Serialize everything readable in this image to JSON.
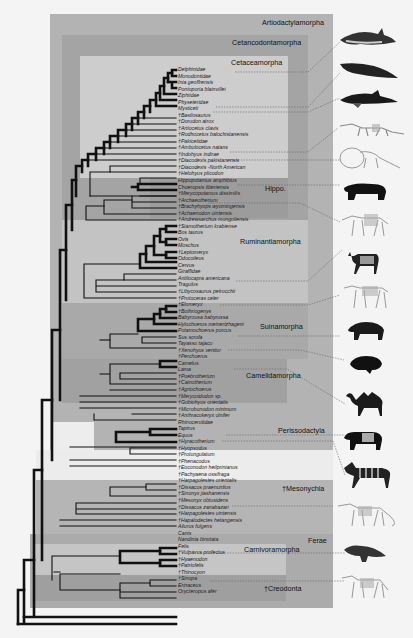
{
  "clades": {
    "artiodactylamorpha": "Artiodactylamorpha",
    "cetancodontamorpha": "Cetancodontamorpha",
    "cetaceamorpha": "Cetaceamorpha",
    "hippo": "Hippo.",
    "ruminantiamorpha": "Ruminantiamorpha",
    "suinamorpha": "Suinamorpha",
    "camelidamorpha": "Camelidamorpha",
    "perissodactyla": "Perissodactyla",
    "mesonychia": "†Mesonychia",
    "ferae": "Ferae",
    "carnivoramorpha": "Carnivoramorpha",
    "creodonta": "†Creodonta"
  },
  "colors": {
    "background": "#f4f4f4",
    "artiodactylamorpha_box": "#b3b3b3",
    "cetancodontamorpha_box": "#a3a3a3",
    "cetaceamorpha_box": "#cfcfcf",
    "hippo_box": "#9b9b9b",
    "ruminantiamorpha_box": "#c2c2c2",
    "suinamorpha_box": "#a8a8a8",
    "camelidamorpha_box": "#a0a0a0",
    "mesonychia_box": "#b5b5b5",
    "ferae_box": "#aaaaaa",
    "carnivoramorpha_box": "#c4c4c4",
    "creodonta_box": "#9e9e9e",
    "branch": "#111111"
  },
  "taxa": [
    "Delphinidae",
    "Monodontidae",
    "Inia geoffrensis",
    "Pontoporia blainvillei",
    "Ziphiidae",
    "Physeteridae",
    "Mysticeti",
    "†Basilosaurus",
    "†Dorudon atrox",
    "†Artiocetus clavis",
    "†Rodhocetus balochistanensis",
    "†Pakicetidae",
    "†Ambulocetus natans",
    "†Indohyus indirae",
    "†Diacodexis pakistanensis",
    "†Diacodexis -North American",
    "†Helohyus plicodon",
    "Hippopotamus amphibius",
    "Choeropsis liberiensis",
    "†Merycopotamus dissimilis",
    "†Archaeotherium",
    "†Brachyhyops wyomingensis",
    "†Achaenodon uintensis",
    "†Andrewsarchus mongoliensis",
    "†Siamotherium krabiense",
    "Bos taurus",
    "Ovis",
    "Moschus",
    "†Leptomeryx",
    "Odocoileus",
    "Cervus",
    "Giraffidae",
    "Antilocapra americana",
    "Tragulus",
    "†Libycosaurus petrocchii",
    "†Protoceras celer",
    "†Elomeryx",
    "†Bothriogenys",
    "Babyrousa babyrussa",
    "Hylochoerus meinertzhageni",
    "Potamochoerus porcus",
    "Sus scrofa",
    "Tayassu tajacu",
    "†Xenohyus venitor",
    "†Perchoerus",
    "Camelus",
    "Lama",
    "†Poebrotherium",
    "†Cainotherium",
    "†Agriochoerus",
    "†Merycoidodon sp.",
    "†Gobiohyus orientalis",
    "†Microbunodon minimum",
    "†Anthracokeryx ulnifer",
    "Rhinocerotidae",
    "Tapirus",
    "Equus",
    "†Hyracotherium",
    "†Hyopsodus",
    "†Protungulatum",
    "†Phenacodus",
    "†Eoconodon heilprinianus",
    "†Pachyaena ossifraga",
    "†Harpagolestes orientalis",
    "†Dissacus praenuntius",
    "†Sinonyx jiashanensis",
    "†Mesonyx obtusidens",
    "†Dissacus zanabazari",
    "†Harpagolestes uintensis",
    "†Hapalodectes hetangensis",
    "Ailurus fulgens",
    "Canis",
    "Nandinia binotata",
    "Felis",
    "†Vulpavus profectus",
    "†Hyaenodon",
    "†Patriofelis",
    "†Thinocyon",
    "†Sinopa",
    "Erinaceus",
    "Orycteropus afer"
  ],
  "illustrations": [
    {
      "name": "dolphin",
      "taxon": "Delphinidae"
    },
    {
      "name": "sperm-whale",
      "taxon": "Physeteridae"
    },
    {
      "name": "humpback-whale",
      "taxon": "Mysticeti"
    },
    {
      "name": "ambulocetus-skeleton",
      "taxon": "†Ambulocetus natans"
    },
    {
      "name": "indohyus-skeleton",
      "taxon": "†Indohyus indirae"
    },
    {
      "name": "hippopotamus",
      "taxon": "Hippopotamus amphibius"
    },
    {
      "name": "archaeotherium-skeleton",
      "taxon": "†Archaeotherium"
    },
    {
      "name": "pronghorn",
      "taxon": "Antilocapra americana"
    },
    {
      "name": "protoceras-skeleton",
      "taxon": "†Protoceras celer"
    },
    {
      "name": "pig",
      "taxon": "Potamochoerus porcus"
    },
    {
      "name": "peccary",
      "taxon": "Tayassu tajacu"
    },
    {
      "name": "camel",
      "taxon": "Camelus"
    },
    {
      "name": "tapir",
      "taxon": "Tapirus"
    },
    {
      "name": "zebra",
      "taxon": "Equus"
    },
    {
      "name": "mesonyx-skeleton",
      "taxon": "†Mesonyx obtusidens"
    },
    {
      "name": "civet",
      "taxon": "Canis"
    },
    {
      "name": "hyaenodon-skeleton",
      "taxon": "†Hyaenodon"
    }
  ]
}
